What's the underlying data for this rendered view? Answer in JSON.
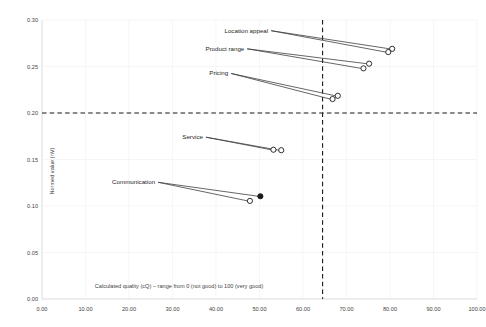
{
  "chart_data": {
    "type": "scatter",
    "title": "",
    "xlabel": "Calculated quality (cQ) – range from 0 (not good) to 100 (very good)",
    "ylabel": "Normed value (nV)",
    "xlim": [
      0,
      100
    ],
    "ylim": [
      0.0,
      0.3
    ],
    "grid": true,
    "legend": "none",
    "xticks": [
      "0.00",
      "10.00",
      "20.00",
      "30.00",
      "40.00",
      "50.00",
      "60.00",
      "70.00",
      "80.00",
      "90.00",
      "100.00"
    ],
    "xtick_values": [
      0,
      10,
      20,
      30,
      40,
      50,
      60,
      70,
      80,
      90,
      100
    ],
    "yticks": [
      "0.00",
      "0.05",
      "0.10",
      "0.15",
      "0.20",
      "0.25",
      "0.30"
    ],
    "ytick_values": [
      0.0,
      0.05,
      0.1,
      0.15,
      0.2,
      0.25,
      0.3
    ],
    "reference_lines": {
      "vertical_x": 64.5,
      "horizontal_y": 0.2,
      "style": "dashed"
    },
    "points": [
      {
        "label": "Location appeal",
        "label_x": 52.0,
        "label_y": 0.2885,
        "marker_open": {
          "x": 80.5,
          "y": 0.269
        },
        "marker_filled": {
          "x": 79.6,
          "y": 0.2655,
          "style": "open"
        }
      },
      {
        "label": "Product range",
        "label_x": 46.5,
        "label_y": 0.269,
        "marker_open": {
          "x": 75.2,
          "y": 0.253
        },
        "marker_filled": {
          "x": 73.9,
          "y": 0.248,
          "style": "open"
        }
      },
      {
        "label": "Pricing",
        "label_x": 42.8,
        "label_y": 0.2425,
        "marker_open": {
          "x": 68.0,
          "y": 0.2185
        },
        "marker_filled": {
          "x": 66.8,
          "y": 0.215,
          "style": "open"
        }
      },
      {
        "label": "Service",
        "label_x": 37.0,
        "label_y": 0.174,
        "marker_open": {
          "x": 53.2,
          "y": 0.1605
        },
        "marker_filled": {
          "x": 55.0,
          "y": 0.16,
          "style": "open"
        }
      },
      {
        "label": "Communication",
        "label_x": 26.0,
        "label_y": 0.1255,
        "marker_open": {
          "x": 47.8,
          "y": 0.1055
        },
        "marker_filled": {
          "x": 50.2,
          "y": 0.1105,
          "style": "filled"
        }
      }
    ]
  }
}
